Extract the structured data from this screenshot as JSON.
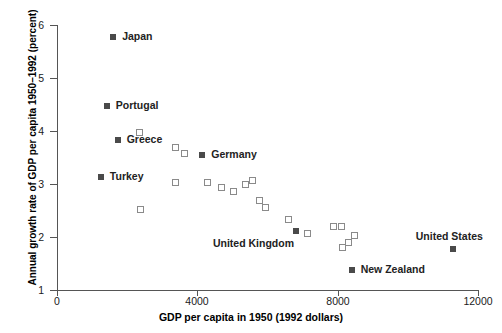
{
  "chart_data": {
    "type": "scatter",
    "title": "",
    "xlabel": "GDP per capita in 1950 (1992 dollars)",
    "ylabel": "Annual growth rate of GDP per capita 1950–1992 (percent)",
    "xlim": [
      0,
      12000
    ],
    "ylim": [
      1,
      6
    ],
    "xticks": [
      0,
      4000,
      8000,
      12000
    ],
    "xtick_labels": [
      "0",
      "4000",
      "8000",
      "12000"
    ],
    "yticks": [
      1,
      2,
      3,
      4,
      5,
      6
    ],
    "ytick_labels": [
      "1",
      "2",
      "3",
      "4",
      "5",
      "6"
    ],
    "grid": false,
    "legend": "none",
    "series": [
      {
        "name": "labeled-countries",
        "marker": "filled-square",
        "color": "#4a4a4a",
        "points": [
          {
            "label": "Japan",
            "x": 1600,
            "y": 5.77,
            "label_dx": 9,
            "label_dy": -6
          },
          {
            "label": "Portugal",
            "x": 1420,
            "y": 4.47,
            "label_dx": 9,
            "label_dy": -6
          },
          {
            "label": "Greece",
            "x": 1730,
            "y": 3.83,
            "label_dx": 9,
            "label_dy": -6
          },
          {
            "label": "Turkey",
            "x": 1250,
            "y": 3.13,
            "label_dx": 9,
            "label_dy": -6
          },
          {
            "label": "Germany",
            "x": 4140,
            "y": 3.54,
            "label_dx": 9,
            "label_dy": -6
          },
          {
            "label": "United Kingdom",
            "x": 6810,
            "y": 2.12,
            "label_dx": -83,
            "label_dy": 7
          },
          {
            "label": "United States",
            "x": 11280,
            "y": 1.78,
            "label_dx": -37,
            "label_dy": -18
          },
          {
            "label": "New Zealand",
            "x": 8400,
            "y": 1.38,
            "label_dx": 9,
            "label_dy": -6
          }
        ]
      },
      {
        "name": "other-countries",
        "marker": "open-square",
        "color": "#8a8a8a",
        "points": [
          {
            "x": 2360,
            "y": 3.97
          },
          {
            "x": 3380,
            "y": 3.69
          },
          {
            "x": 3640,
            "y": 3.57
          },
          {
            "x": 2370,
            "y": 2.52
          },
          {
            "x": 3390,
            "y": 3.03
          },
          {
            "x": 4280,
            "y": 3.02
          },
          {
            "x": 4680,
            "y": 2.94
          },
          {
            "x": 5020,
            "y": 2.86
          },
          {
            "x": 5370,
            "y": 3.0
          },
          {
            "x": 5560,
            "y": 3.07
          },
          {
            "x": 5760,
            "y": 2.68
          },
          {
            "x": 5940,
            "y": 2.56
          },
          {
            "x": 6610,
            "y": 2.33
          },
          {
            "x": 7140,
            "y": 2.06
          },
          {
            "x": 7870,
            "y": 2.2
          },
          {
            "x": 8110,
            "y": 2.2
          },
          {
            "x": 8320,
            "y": 1.9
          },
          {
            "x": 8470,
            "y": 2.02
          },
          {
            "x": 8140,
            "y": 1.8
          }
        ]
      }
    ]
  }
}
